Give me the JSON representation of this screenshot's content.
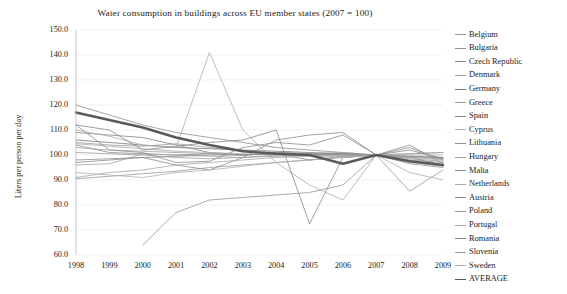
{
  "chart_data": {
    "type": "line",
    "title": "Water consumption in buildings across EU member states (2007 = 100)",
    "xlabel": "",
    "ylabel": "Liters per person per day",
    "x": [
      1998,
      1999,
      2000,
      2001,
      2002,
      2003,
      2004,
      2005,
      2006,
      2007,
      2008,
      2009
    ],
    "categories": [
      "1998",
      "1999",
      "2000",
      "2001",
      "2002",
      "2003",
      "2004",
      "2005",
      "2006",
      "2007",
      "2008",
      "2009"
    ],
    "xlim": [
      1998,
      2009
    ],
    "ylim": [
      60.0,
      150.0
    ],
    "ytick_labels": [
      "150.0",
      "140.0",
      "130.0",
      "120.0",
      "110.0",
      "100.0",
      "90.0",
      "80.0",
      "70.0",
      "60.0"
    ],
    "ytick_values": [
      150.0,
      140.0,
      130.0,
      120.0,
      110.0,
      100.0,
      90.0,
      80.0,
      70.0,
      60.0
    ],
    "grid": true,
    "legend_position": "right",
    "series": [
      {
        "name": "Belgium",
        "color": "#9a9a9a",
        "width": 0.8,
        "values": [
          105.0,
          104.0,
          103.5,
          104.5,
          103.0,
          101.5,
          101.0,
          100.5,
          100.0,
          100.0,
          99.0,
          98.5
        ]
      },
      {
        "name": "Bulgaria",
        "color": "#8f8f8f",
        "width": 0.8,
        "values": [
          120.0,
          116.0,
          112.0,
          109.0,
          107.0,
          105.0,
          103.0,
          102.0,
          101.0,
          100.0,
          98.0,
          97.0
        ]
      },
      {
        "name": "Czech Republic",
        "color": "#8a8a8a",
        "width": 0.8,
        "values": [
          104.0,
          101.0,
          100.5,
          100.0,
          100.5,
          100.0,
          101.0,
          100.5,
          100.5,
          100.0,
          99.0,
          96.0
        ]
      },
      {
        "name": "Denmark",
        "color": "#a3a3a3",
        "width": 0.8,
        "values": [
          96.0,
          96.5,
          100.5,
          100.0,
          99.5,
          99.0,
          100.0,
          100.5,
          101.0,
          100.0,
          97.0,
          95.5
        ]
      },
      {
        "name": "Germany",
        "color": "#777777",
        "width": 0.8,
        "values": [
          106.0,
          105.0,
          104.0,
          103.0,
          102.5,
          102.0,
          101.5,
          101.0,
          100.5,
          100.0,
          99.5,
          99.0
        ]
      },
      {
        "name": "Greece",
        "color": "#999999",
        "width": 0.8,
        "values": [
          90.5,
          91.5,
          92.5,
          93.5,
          95.0,
          96.0,
          97.0,
          98.0,
          99.0,
          100.0,
          100.5,
          101.0
        ]
      },
      {
        "name": "Spain",
        "color": "#858585",
        "width": 0.8,
        "values": [
          109.0,
          108.0,
          107.0,
          104.0,
          101.0,
          100.0,
          100.5,
          98.0,
          99.5,
          100.0,
          97.5,
          96.0
        ]
      },
      {
        "name": "Cyprus",
        "color": "#adadad",
        "width": 0.8,
        "values": [
          110.0,
          107.5,
          104.0,
          103.0,
          141.0,
          110.0,
          97.0,
          88.0,
          82.0,
          100.0,
          93.0,
          90.0
        ]
      },
      {
        "name": "Lithuania",
        "color": "#8d8d8d",
        "width": 0.8,
        "values": [
          97.0,
          98.0,
          99.0,
          96.0,
          94.0,
          99.0,
          106.0,
          108.0,
          109.0,
          100.0,
          104.0,
          96.5
        ]
      },
      {
        "name": "Hungary",
        "color": "#9e9e9e",
        "width": 0.8,
        "values": [
          103.0,
          102.0,
          101.5,
          101.0,
          100.5,
          100.0,
          100.5,
          100.0,
          100.0,
          100.0,
          98.5,
          97.5
        ]
      },
      {
        "name": "Malta",
        "color": "#8c8c8c",
        "width": 0.8,
        "values": [
          112.0,
          102.0,
          101.0,
          97.0,
          97.5,
          103.0,
          105.0,
          104.0,
          108.0,
          100.0,
          103.0,
          98.0
        ]
      },
      {
        "name": "Netherlands",
        "color": "#a8a8a8",
        "width": 0.8,
        "values": [
          104.5,
          103.5,
          102.5,
          101.5,
          101.0,
          100.5,
          100.0,
          100.0,
          100.0,
          100.0,
          99.0,
          98.0
        ]
      },
      {
        "name": "Austria",
        "color": "#8b8b8b",
        "width": 0.8,
        "values": [
          98.0,
          98.5,
          99.0,
          99.5,
          100.0,
          100.0,
          100.5,
          100.0,
          100.5,
          100.0,
          99.5,
          99.0
        ]
      },
      {
        "name": "Poland",
        "color": "#979797",
        "width": 0.8,
        "values": [
          null,
          null,
          64.0,
          77.0,
          82.0,
          83.0,
          84.0,
          85.0,
          88.0,
          100.0,
          96.5,
          95.0
        ]
      },
      {
        "name": "Portugal",
        "color": "#a5a5a5",
        "width": 0.8,
        "values": [
          91.0,
          93.0,
          94.0,
          96.0,
          97.0,
          98.0,
          99.0,
          99.5,
          99.5,
          100.0,
          100.5,
          101.0
        ]
      },
      {
        "name": "Romania",
        "color": "#878787",
        "width": 0.8,
        "values": [
          112.0,
          110.0,
          102.0,
          103.5,
          105.0,
          106.0,
          110.0,
          72.5,
          99.0,
          100.0,
          102.0,
          98.5
        ]
      },
      {
        "name": "Slovenia",
        "color": "#9c9c9c",
        "width": 0.8,
        "values": [
          101.0,
          100.5,
          100.0,
          99.0,
          98.5,
          99.0,
          99.5,
          100.0,
          100.0,
          100.0,
          85.5,
          94.0
        ]
      },
      {
        "name": "Sweden",
        "color": "#b0b0b0",
        "width": 0.8,
        "values": [
          93.0,
          92.0,
          91.0,
          93.0,
          94.0,
          95.5,
          97.0,
          98.0,
          99.0,
          100.0,
          100.0,
          100.0
        ]
      },
      {
        "name": "AVERAGE",
        "color": "#595959",
        "width": 2.4,
        "values": [
          117.0,
          114.0,
          111.0,
          107.0,
          104.0,
          101.5,
          100.5,
          100.0,
          96.5,
          100.0,
          97.5,
          96.0
        ]
      }
    ]
  }
}
